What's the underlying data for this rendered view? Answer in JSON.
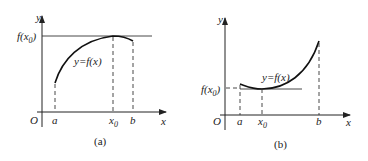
{
  "figure": {
    "panels": [
      {
        "id": "a",
        "caption": "(a)",
        "y_axis_label": "y",
        "x_axis_label": "x",
        "origin_label": "O",
        "curve_label": "y=f(x)",
        "fx0_label": "f(x",
        "fx0_sub": "0",
        "fx0_close": ")",
        "tick_a": "a",
        "tick_x0": "x",
        "tick_x0_sub": "0",
        "tick_b": "b",
        "description": "Increasing-then-decreasing curve on [a,b] with maximum f(x0) at interior point x0"
      },
      {
        "id": "b",
        "caption": "(b)",
        "y_axis_label": "y",
        "x_axis_label": "x",
        "origin_label": "O",
        "curve_label": "y=f(x)",
        "fx0_label": "f(x",
        "fx0_sub": "0",
        "fx0_close": ")",
        "tick_a": "a",
        "tick_x0": "x",
        "tick_x0_sub": "0",
        "tick_b": "b",
        "description": "Decreasing-then-increasing curve on [a,b] with minimum f(x0) at interior point x0"
      }
    ]
  }
}
